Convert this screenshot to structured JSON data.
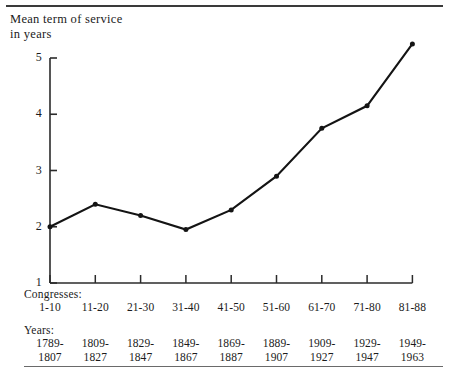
{
  "figure": {
    "axis_title": "Mean term of service\nin years",
    "congresses_heading": "Congresses:",
    "years_heading": "Years:",
    "line_color": "#141414",
    "axis_color": "#2b2b2b"
  },
  "chart_data": {
    "type": "line",
    "title": "Mean term of service in years",
    "xlabel": "Congresses",
    "ylabel": "Mean term of service in years",
    "ylim": [
      1,
      5
    ],
    "yticks": [
      "1",
      "2",
      "3",
      "4",
      "5"
    ],
    "grid": false,
    "legend": "none",
    "categories": [
      "1-10",
      "11-20",
      "21-30",
      "31-40",
      "41-50",
      "51-60",
      "61-70",
      "71-80",
      "81-88"
    ],
    "year_ranges": [
      "1789-\n1807",
      "1809-\n1827",
      "1829-\n1847",
      "1849-\n1867",
      "1869-\n1887",
      "1889-\n1907",
      "1909-\n1927",
      "1929-\n1947",
      "1949-\n1963"
    ],
    "values": [
      2.0,
      2.4,
      2.2,
      1.95,
      2.3,
      2.9,
      3.75,
      4.15,
      5.25
    ],
    "series": [
      {
        "name": "Mean term of service",
        "values": [
          2.0,
          2.4,
          2.2,
          1.95,
          2.3,
          2.9,
          3.75,
          4.15,
          5.25
        ]
      }
    ]
  }
}
